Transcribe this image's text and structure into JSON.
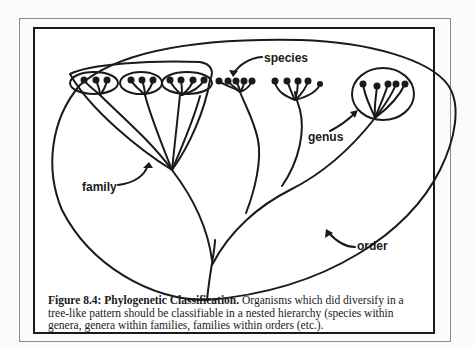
{
  "figure": {
    "labels": {
      "species": "species",
      "genus": "genus",
      "family": "family",
      "order": "order"
    },
    "caption": {
      "title": "Figure 8.4:  Phylogenetic Classification.",
      "line1": "  Organisms which did diversify in a",
      "line2": "tree-like pattern should be classifiable in a nested hierarchy (species within",
      "line3": "genera, genera within families, families within orders (etc.)."
    },
    "hierarchy": {
      "levels": [
        "species",
        "genus",
        "family",
        "order"
      ],
      "genera_in_family": 3,
      "species_per_genus": [
        3,
        3,
        4
      ],
      "free_species_clusters": [
        5,
        5
      ],
      "right_genus_species": 5
    },
    "colors": {
      "ink": "#1a1a1a",
      "outer_frame": "#8a8a8a",
      "background": "#ffffff"
    }
  }
}
